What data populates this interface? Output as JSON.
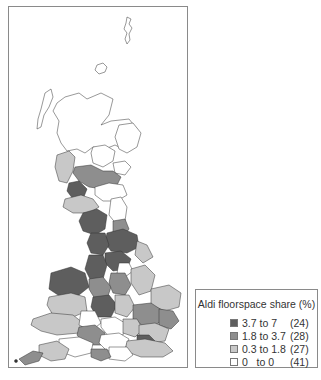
{
  "map": {
    "region": "Great Britain",
    "classes": [
      {
        "key": "high",
        "color": "#5e5e5e"
      },
      {
        "key": "mid",
        "color": "#8e8e8e"
      },
      {
        "key": "low",
        "color": "#c8c8c8"
      },
      {
        "key": "zero",
        "color": "#ffffff"
      }
    ]
  },
  "legend": {
    "title": "Aldi floorspace share (%)",
    "items": [
      {
        "range": "3.7 to 7",
        "count": "(24)",
        "color": "#5e5e5e"
      },
      {
        "range": "1.8 to 3.7",
        "count": "(28)",
        "color": "#8e8e8e"
      },
      {
        "range": "0.3 to 1.8",
        "count": "(27)",
        "color": "#c8c8c8"
      },
      {
        "range": "0   to 0",
        "count": "(41)",
        "color": "#ffffff"
      }
    ]
  }
}
